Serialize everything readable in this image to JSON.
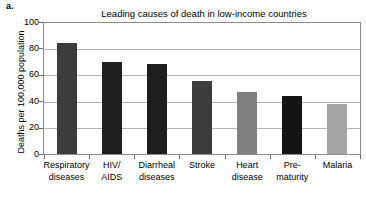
{
  "panel": {
    "label": "a."
  },
  "chart_data": {
    "type": "bar",
    "title": "Leading causes of death in low-income countries",
    "xlabel": "",
    "ylabel": "Deaths per 100,000 population",
    "ylim": [
      0,
      100
    ],
    "yticks": [
      0,
      20,
      40,
      60,
      80,
      100
    ],
    "ytick_labels": [
      "0",
      "20",
      "40",
      "60",
      "80",
      "100"
    ],
    "grid": "horizontal",
    "legend": "none",
    "categories": [
      "Respiratory diseases",
      "HIV/ AIDS",
      "Diarrheal diseases",
      "Stroke",
      "Heart disease",
      "Pre- maturity",
      "Malaria"
    ],
    "category_lines": [
      [
        "Respiratory",
        "diseases"
      ],
      [
        "HIV/",
        "AIDS"
      ],
      [
        "Diarrheal",
        "diseases"
      ],
      [
        "Stroke",
        ""
      ],
      [
        "Heart",
        "disease"
      ],
      [
        "Pre-",
        "maturity"
      ],
      [
        "Malaria",
        ""
      ]
    ],
    "values": [
      85,
      70,
      69,
      56,
      47,
      44,
      38
    ],
    "bar_colors": [
      "#3c3c3c",
      "#1e1e1e",
      "#1e1e1e",
      "#3c3c3c",
      "#808080",
      "#141414",
      "#a5a5a5"
    ]
  },
  "style": {
    "axis_color": "#8c8c8c",
    "grid_color": "#b4b4b4",
    "tick_color": "#6e6e6e",
    "background": "#ffffff",
    "text_color": "#000000"
  }
}
